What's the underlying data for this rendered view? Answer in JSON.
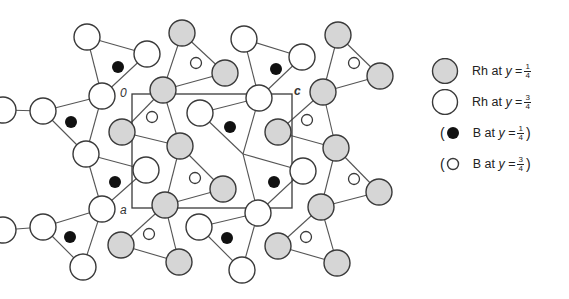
{
  "figure": {
    "cell_labels": {
      "origin": "0",
      "a_axis": "a",
      "c_axis": "c"
    },
    "colors": {
      "stroke": "#3a3a3a",
      "shaded_fill": "#d6d6d6",
      "open_fill": "#ffffff",
      "boron_dark": "#111111",
      "bond": "#555555"
    },
    "unit_cell": {
      "x1": 132,
      "y1": 94,
      "x2": 292,
      "y2": 208
    }
  },
  "legend": {
    "items": [
      {
        "symbol": "shaded-large-circle",
        "element": "Rh",
        "text": "Rh at",
        "var": "y",
        "eq": "=",
        "num": "1",
        "den": "4",
        "paren": false
      },
      {
        "symbol": "open-large-circle",
        "element": "Rh",
        "text": "Rh at",
        "var": "y",
        "eq": "=",
        "num": "3",
        "den": "4",
        "paren": false
      },
      {
        "symbol": "filled-small-circle",
        "element": "B",
        "text": "B at",
        "var": "y",
        "eq": "=",
        "num": "1",
        "den": "4",
        "paren": true
      },
      {
        "symbol": "open-small-circle",
        "element": "B",
        "text": "B at",
        "var": "y",
        "eq": "=",
        "num": "3",
        "den": "4",
        "paren": true
      }
    ],
    "open_paren": "(",
    "close_paren": ")"
  },
  "atoms": {
    "rh_quarter": [
      [
        182,
        33
      ],
      [
        163,
        90
      ],
      [
        122,
        132
      ],
      [
        225,
        73
      ],
      [
        180,
        146
      ],
      [
        338,
        35
      ],
      [
        380,
        76
      ],
      [
        323,
        92
      ],
      [
        278,
        132
      ],
      [
        336,
        148
      ],
      [
        223,
        189
      ],
      [
        165,
        205
      ],
      [
        121,
        245
      ],
      [
        179,
        262
      ],
      [
        379,
        192
      ],
      [
        321,
        207
      ],
      [
        278,
        246
      ],
      [
        337,
        263
      ]
    ],
    "rh_three_quarter": [
      [
        87,
        37
      ],
      [
        147,
        54
      ],
      [
        102,
        96
      ],
      [
        200,
        113
      ],
      [
        244,
        39
      ],
      [
        302,
        57
      ],
      [
        259,
        98
      ],
      [
        43,
        111
      ],
      [
        86,
        154
      ],
      [
        102,
        209
      ],
      [
        43,
        227
      ],
      [
        146,
        170
      ],
      [
        199,
        227
      ],
      [
        83,
        267
      ],
      [
        242,
        270
      ],
      [
        303,
        171
      ],
      [
        258,
        213
      ],
      [
        3,
        110
      ],
      [
        3,
        230
      ]
    ],
    "b_quarter": [
      [
        118,
        67
      ],
      [
        71,
        122
      ],
      [
        230,
        127
      ],
      [
        276,
        69
      ],
      [
        115,
        182
      ],
      [
        70,
        237
      ],
      [
        227,
        238
      ],
      [
        274,
        182
      ]
    ],
    "b_three_quarter": [
      [
        196,
        63
      ],
      [
        152,
        117
      ],
      [
        354,
        63
      ],
      [
        307,
        120
      ],
      [
        195,
        178
      ],
      [
        149,
        234
      ],
      [
        354,
        179
      ],
      [
        306,
        237
      ]
    ]
  },
  "bonds": [
    [
      87,
      37,
      147,
      54
    ],
    [
      87,
      37,
      102,
      96
    ],
    [
      147,
      54,
      102,
      96
    ],
    [
      43,
      111,
      102,
      96
    ],
    [
      43,
      111,
      86,
      154
    ],
    [
      102,
      96,
      86,
      154
    ],
    [
      86,
      154,
      146,
      170
    ],
    [
      86,
      154,
      102,
      209
    ],
    [
      146,
      170,
      102,
      209
    ],
    [
      43,
      227,
      102,
      209
    ],
    [
      43,
      227,
      83,
      267
    ],
    [
      102,
      209,
      83,
      267
    ],
    [
      244,
      39,
      302,
      57
    ],
    [
      244,
      39,
      259,
      98
    ],
    [
      302,
      57,
      259,
      98
    ],
    [
      200,
      113,
      259,
      98
    ],
    [
      200,
      113,
      243,
      154
    ],
    [
      259,
      98,
      243,
      154
    ],
    [
      243,
      154,
      303,
      171
    ],
    [
      243,
      154,
      258,
      213
    ],
    [
      303,
      171,
      258,
      213
    ],
    [
      199,
      227,
      258,
      213
    ],
    [
      199,
      227,
      242,
      270
    ],
    [
      258,
      213,
      242,
      270
    ],
    [
      3,
      110,
      43,
      111
    ],
    [
      3,
      230,
      43,
      227
    ],
    [
      182,
      33,
      225,
      73
    ],
    [
      182,
      33,
      163,
      90
    ],
    [
      225,
      73,
      163,
      90
    ],
    [
      163,
      90,
      122,
      132
    ],
    [
      163,
      90,
      180,
      146
    ],
    [
      122,
      132,
      180,
      146
    ],
    [
      180,
      146,
      223,
      189
    ],
    [
      180,
      146,
      165,
      205
    ],
    [
      223,
      189,
      165,
      205
    ],
    [
      165,
      205,
      121,
      245
    ],
    [
      165,
      205,
      179,
      262
    ],
    [
      121,
      245,
      179,
      262
    ],
    [
      338,
      35,
      380,
      76
    ],
    [
      338,
      35,
      323,
      92
    ],
    [
      380,
      76,
      323,
      92
    ],
    [
      323,
      92,
      278,
      132
    ],
    [
      323,
      92,
      336,
      148
    ],
    [
      278,
      132,
      336,
      148
    ],
    [
      336,
      148,
      379,
      192
    ],
    [
      336,
      148,
      321,
      207
    ],
    [
      379,
      192,
      321,
      207
    ],
    [
      321,
      207,
      278,
      246
    ],
    [
      321,
      207,
      337,
      263
    ],
    [
      278,
      246,
      337,
      263
    ]
  ]
}
